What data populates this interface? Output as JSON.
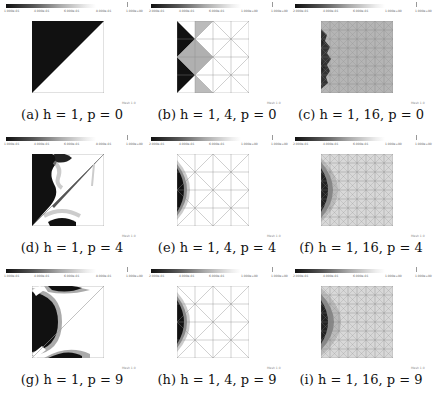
{
  "figure": {
    "panels": [
      {
        "id": "a",
        "caption": "(a) h = 1, p = 0",
        "h": "1",
        "p": "0",
        "mesh_label": "Mesh 1.0",
        "colorbar_ticks": [
          "1.000e-01",
          "4.000e-01",
          "6.000e-01",
          "8.000e-01",
          "1.000e+00"
        ]
      },
      {
        "id": "b",
        "caption": "(b) h = 1, 4, p = 0",
        "h": "1, 4",
        "p": "0",
        "mesh_label": "Mesh 1.0",
        "colorbar_ticks": [
          "2.000e-01",
          "4.000e-01",
          "6.000e-01",
          "1.000e+00",
          "1.000e+00"
        ]
      },
      {
        "id": "c",
        "caption": "(c) h = 1, 16, p = 0",
        "h": "1, 16",
        "p": "0",
        "mesh_label": "Mesh 1.0",
        "colorbar_ticks": [
          "2.000e-01",
          "4.000e-01",
          "6.000e-01",
          "1.000e+00",
          "1.000e+00"
        ]
      },
      {
        "id": "d",
        "caption": "(d) h = 1, p = 4",
        "h": "1",
        "p": "4",
        "mesh_label": "Mesh 1.0",
        "colorbar_ticks": [
          "1.000e-01",
          "4.000e-01",
          "6.000e-01",
          "8.000e-01",
          "1.000e+00"
        ]
      },
      {
        "id": "e",
        "caption": "(e) h = 1, 4, p = 4",
        "h": "1, 4",
        "p": "4",
        "mesh_label": "Mesh 1.0",
        "colorbar_ticks": [
          "2.000e-01",
          "4.000e-01",
          "6.000e-01",
          "1.000e+00",
          "1.000e+00"
        ]
      },
      {
        "id": "f",
        "caption": "(f) h = 1, 16, p = 4",
        "h": "1, 16",
        "p": "4",
        "mesh_label": "Mesh 1.0",
        "colorbar_ticks": [
          "2.000e-01",
          "4.000e-01",
          "6.000e-01",
          "1.000e+00",
          "1.000e+00"
        ]
      },
      {
        "id": "g",
        "caption": "(g) h = 1, p = 9",
        "h": "1",
        "p": "9",
        "mesh_label": "Mesh 1.0",
        "colorbar_ticks": [
          "1.000e-01",
          "4.000e-01",
          "6.000e-01",
          "8.000e-01",
          "1.000e+00"
        ]
      },
      {
        "id": "h",
        "caption": "(h) h = 1, 4, p = 9",
        "h": "1, 4",
        "p": "9",
        "mesh_label": "Mesh 1.0",
        "colorbar_ticks": [
          "2.000e-01",
          "4.000e-01",
          "6.000e-01",
          "1.000e+00",
          "1.000e+00"
        ]
      },
      {
        "id": "i",
        "caption": "(i) h = 1, 16, p = 9",
        "h": "1, 16",
        "p": "9",
        "mesh_label": "Mesh 1.0",
        "colorbar_ticks": [
          "2.000e-01",
          "4.000e-01",
          "6.000e-01",
          "1.000e+00",
          "1.000e+00"
        ]
      }
    ]
  }
}
